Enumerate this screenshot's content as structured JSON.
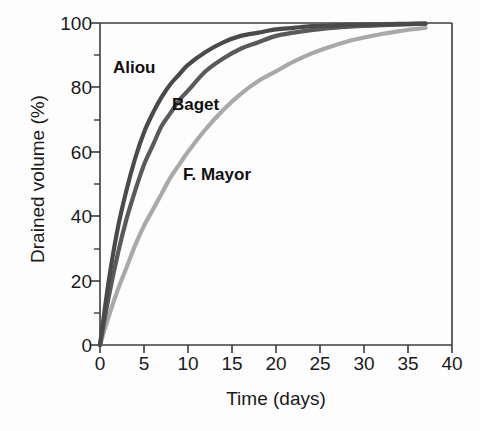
{
  "chart_data": {
    "type": "line",
    "title": "",
    "subtitle": "",
    "xlabel": "Time (days)",
    "ylabel": "Drained volume (%)",
    "xlim": [
      0,
      40
    ],
    "ylim": [
      0,
      100
    ],
    "xticks": [
      0,
      5,
      10,
      15,
      20,
      25,
      30,
      35,
      40
    ],
    "yticks": [
      0,
      20,
      40,
      60,
      80,
      100
    ],
    "y_minor_ticks": [
      10,
      30,
      50,
      70,
      90
    ],
    "grid": false,
    "legend_position": "inline-annotations",
    "x": [
      0,
      1,
      2,
      3,
      4,
      5,
      6,
      7,
      8,
      9,
      10,
      12,
      14,
      16,
      18,
      20,
      22,
      24,
      26,
      28,
      30,
      32,
      34,
      36,
      37
    ],
    "series": [
      {
        "name": "Aliou",
        "color": "#4a4a4a",
        "label_text": "Aliou",
        "values": [
          0,
          20,
          36,
          48,
          58,
          66,
          72,
          77,
          81,
          84,
          87,
          91,
          94,
          96,
          97,
          98,
          98.5,
          99,
          99.2,
          99.4,
          99.5,
          99.6,
          99.7,
          99.8,
          99.8
        ]
      },
      {
        "name": "Baget",
        "color": "#5a5a5a",
        "label_text": "Baget",
        "values": [
          0,
          15,
          28,
          39,
          48,
          56,
          62,
          68,
          72,
          76,
          79,
          85,
          89,
          92,
          94,
          96,
          97,
          97.8,
          98.4,
          98.8,
          99.1,
          99.3,
          99.5,
          99.7,
          99.8
        ]
      },
      {
        "name": "F. Mayor",
        "color": "#a9a9a9",
        "label_text": "F. Mayor",
        "values": [
          0,
          9,
          17,
          24,
          31,
          37,
          42,
          47,
          52,
          56,
          60,
          67,
          73,
          78,
          82,
          85,
          88,
          90.5,
          92.5,
          94.2,
          95.5,
          96.6,
          97.5,
          98.2,
          98.5
        ]
      }
    ]
  },
  "axes": {
    "ylabel": "Drained volume (%)",
    "xlabel": "Time (days)",
    "ytick_labels": [
      "100",
      "80",
      "60",
      "40",
      "20",
      "0"
    ],
    "xtick_labels": [
      "0",
      "5",
      "10",
      "15",
      "20",
      "25",
      "30",
      "35",
      "40"
    ]
  },
  "annotations": {
    "aliou": "Aliou",
    "baget": "Baget",
    "fmayor": "F. Mayor"
  },
  "style": {
    "axis_color": "#3c3c3c",
    "text_color": "#1a1a1a",
    "background": "#fdfdfd",
    "aliou_color": "#4a4a4a",
    "baget_color": "#5a5a5a",
    "fmayor_color": "#a9a9a9"
  }
}
